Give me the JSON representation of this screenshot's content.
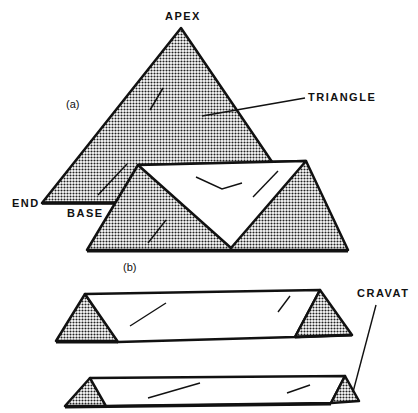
{
  "diagram": {
    "labels": {
      "apex": "APEX",
      "triangle": "TRIANGLE",
      "end": "END",
      "base": "BASE",
      "cravat": "CRAVAT"
    },
    "subfigures": {
      "a": "(a)",
      "b": "(b)"
    },
    "colors": {
      "ink": "#111111",
      "shade_dot": "#222222",
      "paper": "#ffffff"
    }
  }
}
